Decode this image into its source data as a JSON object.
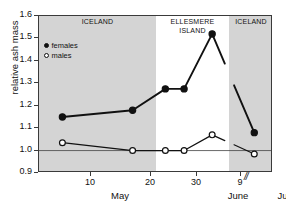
{
  "chart_data": {
    "type": "line",
    "title": "",
    "xlabel": "",
    "ylabel": "relative ash mass",
    "ylim": [
      0.9,
      1.6
    ],
    "grid": false,
    "reference_line_y": 1.0,
    "legend_position": "upper-left-inside",
    "y_ticks": [
      "1.6",
      "1.5",
      "1.4",
      "1.3",
      "1.2",
      "1.1",
      "1.0",
      "0.9"
    ],
    "y_tick_values": [
      1.6,
      1.5,
      1.4,
      1.3,
      1.2,
      1.1,
      1.0,
      0.9
    ],
    "x_ticks": [
      "10",
      "20",
      "30",
      "9"
    ],
    "x_tick_positions": [
      10,
      20,
      30,
      40
    ],
    "x_month_labels": [
      "May",
      "June",
      "July"
    ],
    "axis_break_symbol": "//",
    "regions": [
      {
        "label": "ICELAND",
        "shaded": true
      },
      {
        "label": "ELLESMERE\nISLAND",
        "shaded": false
      },
      {
        "label": "ICELAND",
        "shaded": true
      }
    ],
    "series": [
      {
        "name": "females",
        "marker": "filled-circle",
        "color": "#111111",
        "x": [
          5,
          20,
          27,
          31,
          37,
          46
        ],
        "values": [
          1.15,
          1.18,
          1.275,
          1.275,
          1.52,
          1.08
        ]
      },
      {
        "name": "males",
        "marker": "open-circle",
        "color": "#111111",
        "x": [
          5,
          20,
          27,
          31,
          37,
          46
        ],
        "values": [
          1.035,
          1.0,
          1.0,
          1.0,
          1.07,
          0.985
        ]
      }
    ]
  },
  "legend": {
    "items": [
      {
        "label": "females",
        "marker": "filled"
      },
      {
        "label": "males",
        "marker": "hollow"
      }
    ]
  },
  "colors": {
    "shaded_band": "#d4d4d4",
    "open_band": "#ffffff",
    "line": "#111111",
    "frame": "#3a3a3a"
  }
}
